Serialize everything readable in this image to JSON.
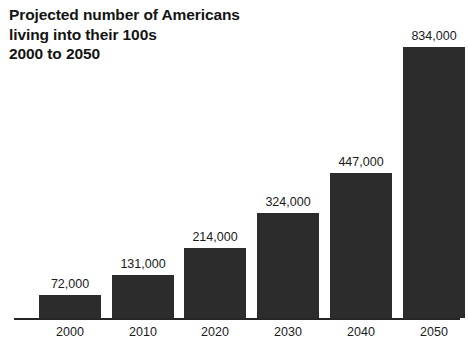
{
  "chart_data": {
    "type": "bar",
    "title": "Projected number of Americans\nliving into their 100s\n2000 to 2050",
    "title_lines": [
      "Projected number of Americans",
      "living into their 100s",
      "2000 to 2050"
    ],
    "xlabel": "",
    "ylabel": "",
    "categories": [
      "2000",
      "2010",
      "2020",
      "2030",
      "2040",
      "2050"
    ],
    "values": [
      72000,
      131000,
      214000,
      324000,
      447000,
      834000
    ],
    "value_labels": [
      "72,000",
      "131,000",
      "214,000",
      "324,000",
      "447,000",
      "834,000"
    ],
    "ylim": [
      0,
      834000
    ],
    "grid": false,
    "legend": null,
    "bar_color": "#2c2c2c",
    "background_color": "#ffffff",
    "axis_color": "#262626"
  }
}
